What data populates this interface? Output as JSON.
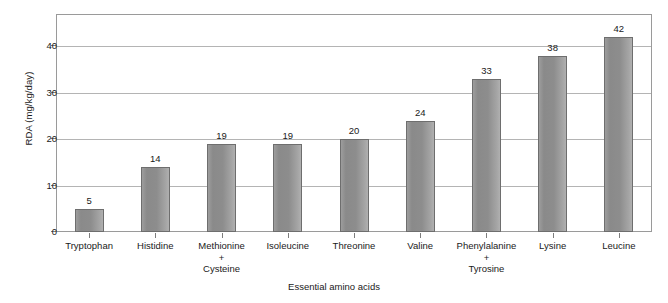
{
  "chart_data": {
    "type": "bar",
    "title": "",
    "xlabel": "Essential amino acids",
    "ylabel": "RDA (mg/kg/day)",
    "categories": [
      "Tryptophan",
      "Histidine",
      "Methionine\n+\nCysteine",
      "Isoleucine",
      "Threonine",
      "Valine",
      "Phenylalanine\n+\nTyrosine",
      "Lysine",
      "Leucine"
    ],
    "values": [
      5,
      14,
      19,
      19,
      20,
      24,
      33,
      38,
      42
    ],
    "value_labels": [
      "5",
      "14",
      "19",
      "19",
      "20",
      "24",
      "33",
      "38",
      "42"
    ],
    "ylim": [
      0,
      47
    ],
    "yticks": [
      0,
      10,
      20,
      30,
      40
    ],
    "ytick_labels": [
      "0",
      "10",
      "20",
      "30",
      "40"
    ],
    "grid": "horizontal",
    "legend": "none",
    "bar_color": "#8f8f8f",
    "bar_border_color": "#6e6e6e",
    "gridline_color": "#b4b4b4",
    "frame_color": "#9a9a9a",
    "text_color": "#1a1a1a"
  }
}
